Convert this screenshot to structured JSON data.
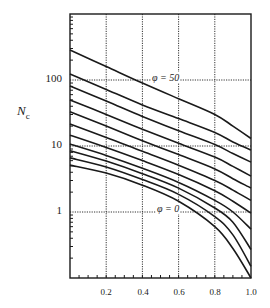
{
  "chart_data": {
    "type": "line",
    "title": "",
    "xlabel": "",
    "ylabel": "N_c",
    "ylabel_main": "N",
    "ylabel_sub": "c",
    "xlim": [
      0.0,
      1.0
    ],
    "ylim": [
      0.1,
      1000
    ],
    "yscale": "log",
    "grid": true,
    "legend": null,
    "x_ticks": [
      "0.2",
      "0.4",
      "0.6",
      "0.8",
      "1.0"
    ],
    "y_ticks": [
      "1",
      "10",
      "100"
    ],
    "annotations": [
      {
        "text": "φ = 50",
        "x": 0.47,
        "y": 100
      },
      {
        "text": "φ = 0",
        "x": 0.47,
        "y": 1
      }
    ],
    "x": [
      0.0,
      0.2,
      0.4,
      0.6,
      0.8,
      0.9,
      1.0
    ],
    "series": [
      {
        "name": "φ = 50",
        "values": [
          285,
          160,
          90,
          52,
          30,
          20,
          13
        ]
      },
      {
        "name": "curve 2",
        "values": [
          123,
          72,
          42,
          26,
          16,
          11.5,
          8.7
        ]
      },
      {
        "name": "curve 3",
        "values": [
          81,
          48,
          28,
          17,
          10.5,
          7.7,
          5.7
        ]
      },
      {
        "name": "curve 4",
        "values": [
          50,
          30,
          18,
          11,
          6.8,
          4.9,
          3.5
        ]
      },
      {
        "name": "curve 5",
        "values": [
          33,
          20,
          12,
          7.4,
          4.5,
          3.2,
          2.3
        ]
      },
      {
        "name": "curve 6",
        "values": [
          21.5,
          13.5,
          8.3,
          5.1,
          3.0,
          2.15,
          1.5
        ]
      },
      {
        "name": "curve 7",
        "values": [
          14.6,
          9.5,
          6.0,
          3.7,
          2.1,
          1.45,
          0.96
        ]
      },
      {
        "name": "curve 8",
        "values": [
          10.7,
          7.2,
          4.6,
          2.8,
          1.5,
          1.0,
          0.55
        ]
      },
      {
        "name": "curve 9",
        "values": [
          8.5,
          5.9,
          3.8,
          2.3,
          1.15,
          0.7,
          0.27
        ]
      },
      {
        "name": "curve 10",
        "values": [
          6.6,
          4.8,
          3.1,
          1.85,
          0.85,
          0.45,
          0.15
        ]
      },
      {
        "name": "φ = 0",
        "values": [
          5.14,
          3.9,
          2.55,
          1.45,
          0.6,
          0.28,
          0.1
        ]
      }
    ]
  },
  "labels": {
    "ytick_100": "100",
    "ytick_10": "10",
    "ytick_1": "1",
    "xtick_02": "0.2",
    "xtick_04": "0.4",
    "xtick_06": "0.6",
    "xtick_08": "0.8",
    "xtick_10": "1.0",
    "anno_top": "φ = 50",
    "anno_bottom": "φ = 0"
  },
  "colors": {
    "line": "#1a1a1a",
    "grid": "#333333",
    "axis": "#1a1a1a"
  }
}
